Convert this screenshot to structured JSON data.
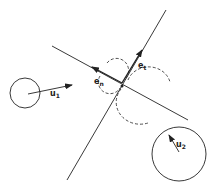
{
  "diagram": {
    "type": "collision-contact-geometry",
    "labels": {
      "u1": {
        "base": "u",
        "sub": "1"
      },
      "u2": {
        "base": "u",
        "sub": "2"
      },
      "en": {
        "base": "e",
        "sub": "n"
      },
      "et": {
        "base": "e",
        "sub": "t"
      }
    },
    "colors": {
      "stroke": "#222222",
      "background": "#ffffff"
    },
    "bodies": [
      {
        "name": "body-1",
        "center": [
          25,
          93
        ],
        "radius": 15
      },
      {
        "name": "body-2",
        "center": [
          179,
          154
        ],
        "radius": 27
      }
    ],
    "contact_point": [
      122,
      85
    ]
  }
}
